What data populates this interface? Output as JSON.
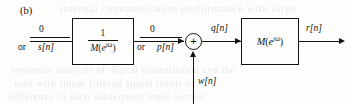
{
  "figure": {
    "panel_label": "(b)",
    "caption": ""
  },
  "diagram": {
    "type": "block-diagram",
    "input_left": {
      "top_label": "0",
      "or_word": "or",
      "bottom_label": "s[n]"
    },
    "block_inverse": {
      "numerator": "1",
      "denominator_fn": "M",
      "denominator_arg_base": "e",
      "denominator_arg_sup_j": "j",
      "denominator_arg_sup_omega": "Ω",
      "open_paren": "(",
      "close_paren": ")"
    },
    "mid_signal": {
      "top_label": "0",
      "or_word": "or",
      "bottom_label": "p[n]"
    },
    "adder": {
      "sign": "+"
    },
    "noise_input": {
      "label": "w[n]"
    },
    "sum_output": {
      "label": "q[n]"
    },
    "block_forward": {
      "fn": "M",
      "arg_base": "e",
      "arg_sup_j": "j",
      "arg_sup_omega": "Ω",
      "open_paren": "(",
      "close_paren": ")"
    },
    "output": {
      "label": "r[n]"
    }
  },
  "background": {
    "bleed_lines": [
      "internal communication performance with large",
      "sequence analysis of digital transmission and the",
      "user with linear filtered signal levels of",
      "difference in each subsequent input section"
    ]
  },
  "colors": {
    "ink": "#111111",
    "paper": "#fdfdfb",
    "ghost": "#6b6152"
  }
}
